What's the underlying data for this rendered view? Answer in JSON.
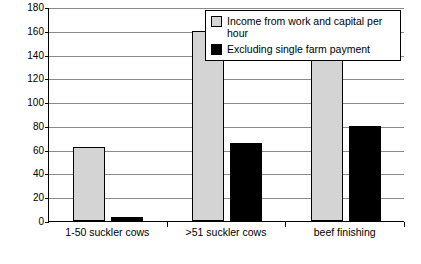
{
  "chart_data": {
    "type": "bar",
    "title": "",
    "xlabel": "",
    "ylabel": "",
    "ylim": [
      0,
      180
    ],
    "ytick_step": 20,
    "yticks": [
      "0",
      "20",
      "40",
      "60",
      "80",
      "100",
      "120",
      "140",
      "160",
      "180"
    ],
    "grid": true,
    "legend_position": "top-right",
    "categories": [
      "1-50 suckler cows",
      ">51 suckler cows",
      "beef finishing"
    ],
    "series": [
      {
        "name": "Income from work and capital per hour",
        "color": "#d4d4d4",
        "values": [
          62,
          160,
          146
        ]
      },
      {
        "name": "Excluding single farm payment",
        "color": "#000000",
        "values": [
          3,
          66,
          80
        ]
      }
    ]
  },
  "legend": {
    "items": [
      {
        "label": "Income from work and capital per hour"
      },
      {
        "label": "Excluding single farm payment"
      }
    ]
  }
}
